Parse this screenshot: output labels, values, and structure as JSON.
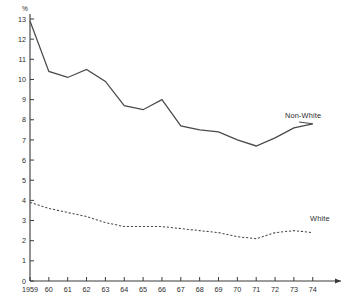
{
  "chart_data": {
    "type": "line",
    "title": "",
    "subtitle": "",
    "xlabel": "",
    "ylabel": "",
    "unit_label": "%",
    "grid": false,
    "legend_position": "inline-right",
    "xlim": [
      1959,
      1974
    ],
    "ylim": [
      0,
      13
    ],
    "y_ticks": [
      0,
      1,
      2,
      3,
      4,
      5,
      6,
      7,
      8,
      9,
      10,
      11,
      12,
      13
    ],
    "y_tick_labels": [
      "0",
      "1",
      "2",
      "3",
      "4",
      "5",
      "6",
      "7",
      "8",
      "9",
      "10",
      "11",
      "12",
      "13"
    ],
    "x": [
      1959,
      1960,
      1961,
      1962,
      1963,
      1964,
      1965,
      1966,
      1967,
      1968,
      1969,
      1970,
      1971,
      1972,
      1973,
      1974
    ],
    "x_tick_labels": [
      "1959",
      "60",
      "61",
      "62",
      "63",
      "64",
      "65",
      "66",
      "67",
      "68",
      "69",
      "70",
      "71",
      "72",
      "73",
      "74"
    ],
    "series": [
      {
        "name": "Non-White",
        "style": "solid",
        "color": "#4a4a4a",
        "label": "Non-White",
        "values": [
          12.9,
          10.4,
          10.1,
          10.5,
          9.9,
          8.7,
          8.5,
          9.0,
          7.7,
          7.5,
          7.4,
          7.0,
          6.7,
          7.1,
          7.6,
          7.8
        ]
      },
      {
        "name": "White",
        "style": "dashed",
        "color": "#4a4a4a",
        "label": "White",
        "values": [
          3.9,
          3.6,
          3.4,
          3.2,
          2.9,
          2.7,
          2.7,
          2.7,
          2.6,
          2.5,
          2.4,
          2.2,
          2.1,
          2.4,
          2.5,
          2.4
        ]
      }
    ]
  },
  "geometry": {
    "plot_left": 30,
    "plot_right": 333,
    "plot_top": 19,
    "plot_bottom": 281,
    "x_step": 18.85
  },
  "annotations": {
    "nonwhite_label_x": 285,
    "nonwhite_label_y": 118,
    "white_label_x": 310,
    "white_label_y": 221
  }
}
